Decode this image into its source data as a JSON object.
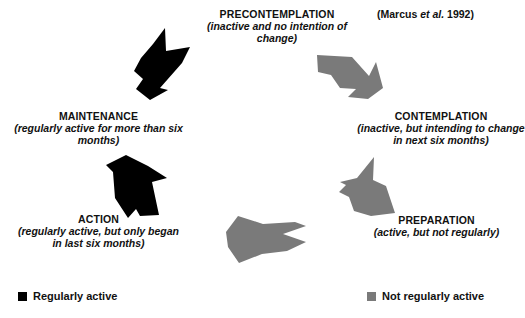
{
  "figure": {
    "citation": {
      "prefix": "(Marcus ",
      "italic": "et al.",
      "suffix": " 1992)"
    }
  },
  "stages": [
    {
      "id": "precontemplation",
      "title": "PRECONTEMPLATION",
      "desc": "(inactive and no intention of change)",
      "color": "#7a7a7a"
    },
    {
      "id": "contemplation",
      "title": "CONTEMPLATION",
      "desc": "(inactive, but intending to change in next six months)",
      "color": "#7a7a7a"
    },
    {
      "id": "preparation",
      "title": "PREPARATION",
      "desc": "(active, but not regularly)",
      "color": "#7a7a7a"
    },
    {
      "id": "action",
      "title": "ACTION",
      "desc": "(regularly active, but only began in last six months)",
      "color": "#000000"
    },
    {
      "id": "maintenance",
      "title": "MAINTENANCE",
      "desc": "(regularly active for more than six months)",
      "color": "#000000"
    }
  ],
  "arrows": [
    {
      "id": "arrow-maintenance-to-precontemplation",
      "color": "#000000"
    },
    {
      "id": "arrow-precontemplation-to-contemplation",
      "color": "#7a7a7a"
    },
    {
      "id": "arrow-contemplation-to-preparation",
      "color": "#7a7a7a"
    },
    {
      "id": "arrow-preparation-to-action",
      "color": "#7a7a7a"
    },
    {
      "id": "arrow-action-to-maintenance",
      "color": "#000000"
    }
  ],
  "legend": {
    "regularly_active": {
      "label": "Regularly active",
      "color": "#000000"
    },
    "not_regularly_active": {
      "label": "Not regularly active",
      "color": "#7a7a7a"
    }
  }
}
